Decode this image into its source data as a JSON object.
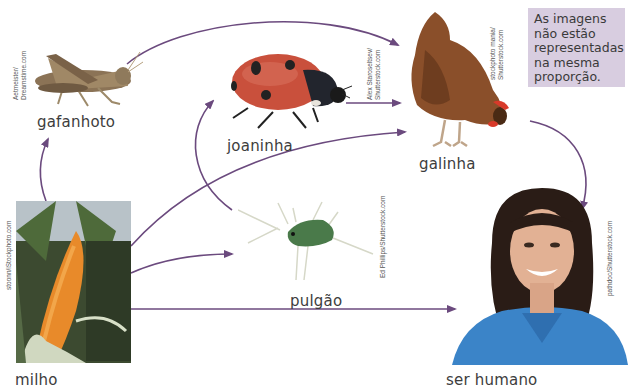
{
  "note": {
    "lines": [
      "As imagens",
      "não estão",
      "representadas",
      "na mesma",
      "proporção."
    ],
    "background": "#d8cde0"
  },
  "organisms": {
    "grasshopper": {
      "label": "gafanhoto",
      "credit": "Aetmeister/\nDreamstime.com"
    },
    "ladybug": {
      "label": "joaninha",
      "credit": "Alex Staroseltsev/\nShutterstock.com"
    },
    "chicken": {
      "label": "galinha",
      "credit": "stockphoto mania/\nShutterstock.com"
    },
    "aphid": {
      "label": "pulgão",
      "credit": "Ed Phillips/Shutterstock.com"
    },
    "corn": {
      "label": "milho",
      "credit": "stoonn/iStockphoto.com"
    },
    "human": {
      "label": "ser humano",
      "credit": "pathdoc/Shutterstock.com"
    }
  },
  "arrows": {
    "color": "#6b4a7e",
    "relations": [
      {
        "from": "milho",
        "to": "gafanhoto"
      },
      {
        "from": "milho",
        "to": "pulgão"
      },
      {
        "from": "milho",
        "to": "galinha"
      },
      {
        "from": "milho",
        "to": "ser humano"
      },
      {
        "from": "gafanhoto",
        "to": "galinha"
      },
      {
        "from": "pulgão",
        "to": "joaninha"
      },
      {
        "from": "joaninha",
        "to": "galinha"
      },
      {
        "from": "galinha",
        "to": "ser humano"
      }
    ]
  }
}
